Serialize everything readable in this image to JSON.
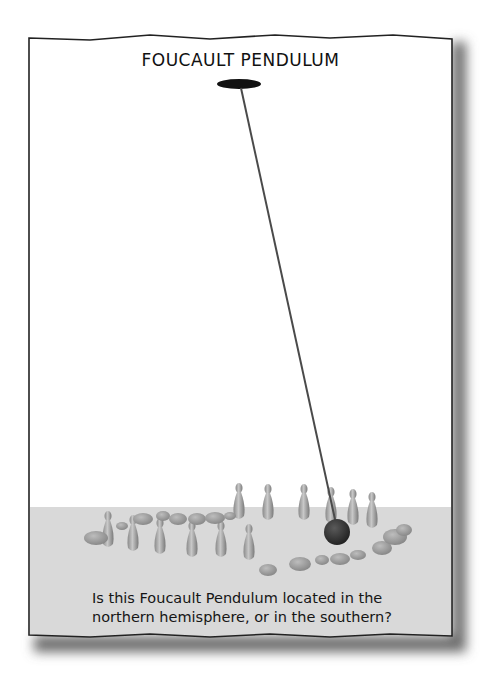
{
  "panel": {
    "title": "FOUCAULT PENDULUM",
    "caption_line1": "Is this Foucault Pendulum located in the",
    "caption_line2": "northern hemisphere, or in the southern?"
  },
  "colors": {
    "paper": "#ffffff",
    "floor": "#d9d9d9",
    "frame_stroke": "#222222",
    "rope": "#4a4a4a",
    "bob": "#3a3a3a",
    "pin": "#a9a9a9"
  }
}
